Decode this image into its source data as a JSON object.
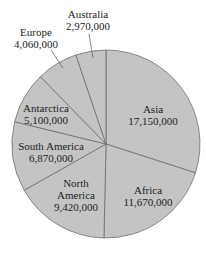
{
  "chart_data": {
    "type": "pie",
    "title": "",
    "start_angle_deg": 0,
    "direction": "clockwise",
    "slices": [
      {
        "label": "Asia",
        "value": 17150000,
        "value_label": "17,150,000"
      },
      {
        "label": "Africa",
        "value": 11670000,
        "value_label": "11,670,000"
      },
      {
        "label": "North America",
        "value": 9420000,
        "value_label": "9,420,000"
      },
      {
        "label": "South America",
        "value": 6870000,
        "value_label": "6,870,000"
      },
      {
        "label": "Antarctica",
        "value": 5100000,
        "value_label": "5,100,000"
      },
      {
        "label": "Europe",
        "value": 4060000,
        "value_label": "4,060,000"
      },
      {
        "label": "Australia",
        "value": 2970000,
        "value_label": "2,970,000"
      }
    ],
    "colors": {
      "fill": "#c4c4c4",
      "stroke": "#6f6f6f"
    },
    "legend": "none"
  },
  "labels": {
    "asia": {
      "name": "Asia",
      "value": "17,150,000"
    },
    "africa": {
      "name": "Africa",
      "value": "11,670,000"
    },
    "north_america": {
      "name1": "North",
      "name2": "America",
      "value": "9,420,000"
    },
    "south_america": {
      "name": "South America",
      "value": "6,870,000"
    },
    "antarctica": {
      "name": "Antarctica",
      "value": "5,100,000"
    },
    "europe": {
      "name": "Europe",
      "value": "4,060,000"
    },
    "australia": {
      "name": "Australia",
      "value": "2,970,000"
    }
  }
}
